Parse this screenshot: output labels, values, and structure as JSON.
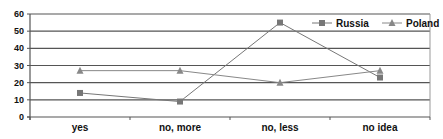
{
  "chart_data": {
    "type": "line",
    "title": "",
    "xlabel": "",
    "ylabel": "",
    "categories": [
      "yes",
      "no, more",
      "no, less",
      "no idea"
    ],
    "ylim": [
      0,
      60
    ],
    "yticks": [
      0,
      10,
      20,
      30,
      40,
      50,
      60
    ],
    "grid": true,
    "legend_position": "top-right",
    "series": [
      {
        "name": "Russia",
        "marker": "square",
        "color": "#777777",
        "values": [
          14,
          9,
          55,
          23
        ]
      },
      {
        "name": "Poland",
        "marker": "triangle",
        "color": "#888888",
        "values": [
          27,
          27,
          20,
          27
        ]
      }
    ]
  }
}
